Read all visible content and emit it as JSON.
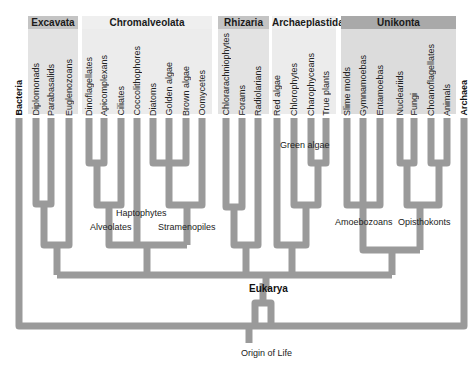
{
  "colors": {
    "branch": "#9a9a9a",
    "band_light": "#ececec",
    "band_header_dark": "#c4c4c4",
    "band_header_unikonta": "#a9a9a9",
    "text": "#222222"
  },
  "supergroups": [
    {
      "label": "Excavata",
      "x": 28,
      "w": 50,
      "style": "dark"
    },
    {
      "label": "Chromalveolata",
      "x": 82,
      "w": 130,
      "style": "light"
    },
    {
      "label": "Rhizaria",
      "x": 218,
      "w": 51,
      "style": "dark"
    },
    {
      "label": "Archaeplastida",
      "x": 272,
      "w": 64,
      "style": "light"
    },
    {
      "label": "Unikonta",
      "x": 341,
      "w": 115,
      "style": "uni"
    }
  ],
  "taxa": [
    {
      "label": "Bacteria",
      "x": 19,
      "bold": true
    },
    {
      "label": "Diplomonads",
      "x": 36
    },
    {
      "label": "Parabasalids",
      "x": 51
    },
    {
      "label": "Euglenozoans",
      "x": 69
    },
    {
      "label": "Dinoflagellates",
      "x": 89
    },
    {
      "label": "Apicomplexans",
      "x": 104
    },
    {
      "label": "Ciliates",
      "x": 121
    },
    {
      "label": "Coccolithophores",
      "x": 137
    },
    {
      "label": "Diatoms",
      "x": 153
    },
    {
      "label": "Golden algae",
      "x": 169
    },
    {
      "label": "Brown algae",
      "x": 186
    },
    {
      "label": "Oomycetes",
      "x": 202
    },
    {
      "label": "Chlorarachniophytes",
      "x": 226
    },
    {
      "label": "Forams",
      "x": 242
    },
    {
      "label": "Radiolarians",
      "x": 258
    },
    {
      "label": "Red algae",
      "x": 277
    },
    {
      "label": "Chlorophytes",
      "x": 294
    },
    {
      "label": "Charophyceans",
      "x": 311
    },
    {
      "label": "True plants",
      "x": 326
    },
    {
      "label": "Slime molds",
      "x": 347
    },
    {
      "label": "Gymnamoebas",
      "x": 363
    },
    {
      "label": "Entamoebas",
      "x": 380
    },
    {
      "label": "Nucleariids",
      "x": 400
    },
    {
      "label": "Fungi",
      "x": 414
    },
    {
      "label": "Choanoflagellates",
      "x": 431
    },
    {
      "label": "Animals",
      "x": 447
    },
    {
      "label": "Archaea",
      "x": 464,
      "bold": true
    }
  ],
  "clade_labels": [
    {
      "label": "Haptophytes",
      "x": 116,
      "y": 208
    },
    {
      "label": "Alveolates",
      "x": 90,
      "y": 222
    },
    {
      "label": "Stramenopiles",
      "x": 158,
      "y": 222
    },
    {
      "label": "Green algae",
      "x": 280,
      "y": 140
    },
    {
      "label": "Amoebozoans",
      "x": 335,
      "y": 217
    },
    {
      "label": "Opisthokonts",
      "x": 398,
      "y": 217
    },
    {
      "label": "Eukarya",
      "x": 249,
      "y": 283,
      "bold": true
    },
    {
      "label": "Origin of Life",
      "x": 241,
      "y": 348
    }
  ]
}
